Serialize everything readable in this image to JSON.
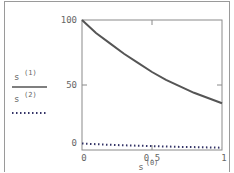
{
  "chart_data": {
    "type": "line",
    "title": "",
    "xlabel": "s(0)",
    "ylabel": "",
    "xlim": [
      0,
      1
    ],
    "ylim": [
      0,
      100
    ],
    "x_ticks": [
      "0",
      "0.5",
      "1"
    ],
    "y_ticks": [
      "0",
      "50",
      "100"
    ],
    "grid": false,
    "legend_position": "left",
    "x": [
      0,
      0.1,
      0.2,
      0.3,
      0.4,
      0.5,
      0.6,
      0.7,
      0.8,
      0.9,
      1.0
    ],
    "series": [
      {
        "name": "s(1)",
        "style": "solid",
        "color": "#555555",
        "values": [
          100,
          90,
          82,
          74,
          67,
          60,
          54,
          49,
          44,
          40,
          36
        ]
      },
      {
        "name": "s(2)",
        "style": "dotted",
        "color": "#333366",
        "values": [
          5,
          4.5,
          4,
          3.6,
          3.3,
          3,
          2.7,
          2.4,
          2.2,
          2,
          1.8
        ]
      }
    ]
  },
  "legend": {
    "series1_label": "s",
    "series1_sup": "(1)",
    "series2_label": "s",
    "series2_sup": "(2)"
  },
  "axes": {
    "x_label": "s",
    "x_label_sup": "(0)",
    "y_tick_0": "0",
    "y_tick_50": "50",
    "y_tick_100": "100",
    "x_tick_0": "0",
    "x_tick_05": "0.5",
    "x_tick_1": "1"
  }
}
